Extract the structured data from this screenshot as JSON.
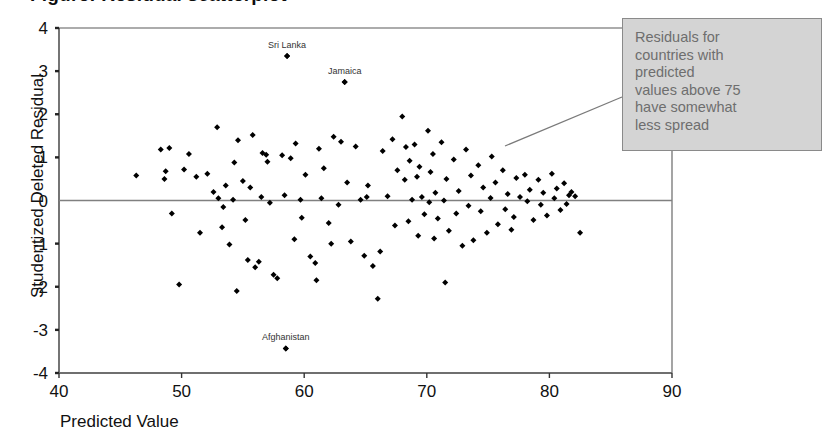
{
  "title": "Figure: Residual scatterplot",
  "axes": {
    "x": {
      "label": "Predicted Value",
      "ticks": [
        40,
        50,
        60,
        70,
        80,
        90
      ],
      "min": 40,
      "max": 90
    },
    "y": {
      "label": "Studentized Deleted Residual",
      "ticks": [
        4,
        3,
        2,
        1,
        0,
        -1,
        -2,
        -3,
        -4
      ],
      "min": -4,
      "max": 4
    }
  },
  "callout": {
    "text": "Residuals for countries with predicted values above 75 have somewhat less spread",
    "lines": [
      "Residuals for",
      "countries with",
      "predicted",
      "values above 75",
      "have somewhat",
      "less spread"
    ],
    "background_color": "#d4d4d4",
    "border_color": "#8a8a8a",
    "text_color": "#6e6e6e"
  },
  "chart_data": {
    "type": "scatter",
    "xlabel": "Predicted Value",
    "ylabel": "Studentized Deleted Residual",
    "xlim": [
      40,
      90
    ],
    "ylim": [
      -4,
      4
    ],
    "xticks": [
      40,
      50,
      60,
      70,
      80,
      90
    ],
    "yticks": [
      4,
      3,
      2,
      1,
      0,
      -1,
      -2,
      -3,
      -4
    ],
    "grid": false,
    "legend": "none",
    "reference_line": {
      "orientation": "horizontal",
      "y": 0,
      "color": "#808080"
    },
    "marker": {
      "shape": "diamond",
      "color": "#000000",
      "size": 3
    },
    "annotations": [
      {
        "label": "Sri Lanka",
        "x": 58.6,
        "y": 3.35
      },
      {
        "label": "Jamaica",
        "x": 63.3,
        "y": 2.75
      },
      {
        "label": "Afghanistan",
        "x": 58.5,
        "y": -3.43
      }
    ],
    "points": [
      [
        46.3,
        0.58
      ],
      [
        48.3,
        1.18
      ],
      [
        49.0,
        1.22
      ],
      [
        48.7,
        0.68
      ],
      [
        48.6,
        0.5
      ],
      [
        49.2,
        -0.3
      ],
      [
        49.8,
        -1.95
      ],
      [
        50.2,
        0.72
      ],
      [
        50.6,
        1.08
      ],
      [
        51.2,
        0.55
      ],
      [
        51.5,
        -0.75
      ],
      [
        52.1,
        0.62
      ],
      [
        52.6,
        0.2
      ],
      [
        52.9,
        1.7
      ],
      [
        53.0,
        0.05
      ],
      [
        53.4,
        -0.15
      ],
      [
        53.6,
        0.35
      ],
      [
        53.3,
        -0.62
      ],
      [
        53.9,
        -1.02
      ],
      [
        54.3,
        0.88
      ],
      [
        54.6,
        1.4
      ],
      [
        54.2,
        0.02
      ],
      [
        54.5,
        -2.1
      ],
      [
        55.0,
        0.45
      ],
      [
        55.4,
        -1.38
      ],
      [
        55.8,
        1.52
      ],
      [
        55.6,
        0.3
      ],
      [
        56.0,
        -1.55
      ],
      [
        56.3,
        -1.42
      ],
      [
        56.6,
        1.1
      ],
      [
        56.9,
        1.06
      ],
      [
        56.5,
        0.08
      ],
      [
        57.2,
        -0.05
      ],
      [
        57.5,
        -1.72
      ],
      [
        57.8,
        -1.8
      ],
      [
        58.6,
        3.35
      ],
      [
        58.5,
        -3.43
      ],
      [
        58.2,
        1.05
      ],
      [
        58.9,
        0.98
      ],
      [
        58.4,
        0.12
      ],
      [
        59.3,
        1.32
      ],
      [
        59.7,
        0.02
      ],
      [
        59.2,
        -0.9
      ],
      [
        60.1,
        0.6
      ],
      [
        60.5,
        -1.3
      ],
      [
        60.9,
        -1.45
      ],
      [
        61.2,
        1.2
      ],
      [
        61.6,
        0.75
      ],
      [
        61.4,
        0.05
      ],
      [
        62.0,
        -0.52
      ],
      [
        62.4,
        1.48
      ],
      [
        62.8,
        -0.1
      ],
      [
        63.3,
        2.75
      ],
      [
        63.0,
        1.36
      ],
      [
        63.5,
        0.42
      ],
      [
        63.8,
        -0.95
      ],
      [
        64.2,
        1.25
      ],
      [
        64.6,
        0.02
      ],
      [
        64.9,
        -1.28
      ],
      [
        65.2,
        0.35
      ],
      [
        65.6,
        -1.52
      ],
      [
        65.1,
        0.08
      ],
      [
        66.0,
        -2.28
      ],
      [
        66.4,
        1.15
      ],
      [
        66.8,
        0.1
      ],
      [
        67.2,
        1.42
      ],
      [
        67.6,
        0.7
      ],
      [
        67.4,
        -0.58
      ],
      [
        68.0,
        1.95
      ],
      [
        68.3,
        1.24
      ],
      [
        68.6,
        0.92
      ],
      [
        68.2,
        0.48
      ],
      [
        68.8,
        0.02
      ],
      [
        68.5,
        -0.48
      ],
      [
        69.0,
        1.3
      ],
      [
        69.4,
        0.78
      ],
      [
        69.2,
        0.55
      ],
      [
        69.6,
        0.08
      ],
      [
        69.8,
        -0.32
      ],
      [
        69.3,
        -0.82
      ],
      [
        70.1,
        1.62
      ],
      [
        70.5,
        1.08
      ],
      [
        70.3,
        0.66
      ],
      [
        70.7,
        0.18
      ],
      [
        70.2,
        -0.04
      ],
      [
        70.9,
        -0.42
      ],
      [
        70.6,
        -0.88
      ],
      [
        71.2,
        1.35
      ],
      [
        71.6,
        0.5
      ],
      [
        71.4,
        0.0
      ],
      [
        71.8,
        -0.7
      ],
      [
        71.5,
        -1.9
      ],
      [
        72.2,
        0.95
      ],
      [
        72.6,
        0.22
      ],
      [
        72.4,
        -0.3
      ],
      [
        72.9,
        -1.05
      ],
      [
        73.2,
        1.18
      ],
      [
        73.6,
        0.58
      ],
      [
        73.4,
        -0.12
      ],
      [
        73.8,
        -0.92
      ],
      [
        74.2,
        0.82
      ],
      [
        74.6,
        0.3
      ],
      [
        74.4,
        -0.25
      ],
      [
        74.9,
        -0.75
      ],
      [
        75.3,
        1.02
      ],
      [
        75.6,
        0.42
      ],
      [
        75.2,
        0.06
      ],
      [
        75.8,
        -0.55
      ],
      [
        76.2,
        0.7
      ],
      [
        76.6,
        0.15
      ],
      [
        76.4,
        -0.2
      ],
      [
        76.9,
        -0.68
      ],
      [
        77.3,
        0.52
      ],
      [
        77.6,
        0.08
      ],
      [
        77.1,
        -0.38
      ],
      [
        78.0,
        0.6
      ],
      [
        78.4,
        0.25
      ],
      [
        78.2,
        -0.02
      ],
      [
        78.7,
        -0.45
      ],
      [
        79.1,
        0.48
      ],
      [
        79.5,
        0.18
      ],
      [
        79.3,
        -0.1
      ],
      [
        79.8,
        -0.35
      ],
      [
        80.2,
        0.62
      ],
      [
        80.6,
        0.28
      ],
      [
        80.4,
        0.05
      ],
      [
        80.9,
        -0.22
      ],
      [
        81.2,
        0.4
      ],
      [
        81.6,
        0.12
      ],
      [
        81.4,
        -0.08
      ],
      [
        81.8,
        0.2
      ],
      [
        82.1,
        0.1
      ],
      [
        82.5,
        -0.75
      ],
      [
        66.2,
        -1.18
      ],
      [
        62.2,
        -1.0
      ],
      [
        61.0,
        -1.85
      ],
      [
        59.8,
        -0.4
      ],
      [
        57.0,
        0.9
      ],
      [
        55.2,
        -0.45
      ]
    ]
  }
}
